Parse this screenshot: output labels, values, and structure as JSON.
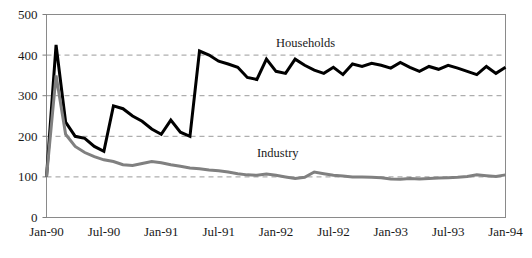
{
  "chart_data": {
    "type": "line",
    "title": "",
    "subtitle": "",
    "xlabel": "",
    "ylabel": "",
    "ylim": [
      0,
      500
    ],
    "yticks": [
      0,
      100,
      200,
      300,
      400,
      500
    ],
    "ytick_labels": [
      "0",
      "100",
      "200",
      "300",
      "400",
      "500"
    ],
    "gridlines": {
      "horizontal": [
        100,
        200,
        300,
        400
      ],
      "style": "dashed",
      "vertical": false
    },
    "legend": {
      "position": "inline-annotation",
      "entries": [
        "Households",
        "Industry"
      ]
    },
    "annotations": [
      {
        "text": "Households",
        "x": "Jan-92",
        "y": 420
      },
      {
        "text": "Industry",
        "x": "Nov-91",
        "y": 150
      }
    ],
    "xtick_labels": [
      "Jan-90",
      "Jul-90",
      "Jan-91",
      "Jul-91",
      "Jan-92",
      "Jul-92",
      "Jan-93",
      "Jul-93",
      "Jan-94"
    ],
    "x": [
      "Jan-90",
      "Feb-90",
      "Mar-90",
      "Apr-90",
      "May-90",
      "Jun-90",
      "Jul-90",
      "Aug-90",
      "Sep-90",
      "Oct-90",
      "Nov-90",
      "Dec-90",
      "Jan-91",
      "Feb-91",
      "Mar-91",
      "Apr-91",
      "May-91",
      "Jun-91",
      "Jul-91",
      "Aug-91",
      "Sep-91",
      "Oct-91",
      "Nov-91",
      "Dec-91",
      "Jan-92",
      "Feb-92",
      "Mar-92",
      "Apr-92",
      "May-92",
      "Jun-92",
      "Jul-92",
      "Aug-92",
      "Sep-92",
      "Oct-92",
      "Nov-92",
      "Dec-92",
      "Jan-93",
      "Feb-93",
      "Mar-93",
      "Apr-93",
      "May-93",
      "Jun-93",
      "Jul-93",
      "Aug-93",
      "Sep-93",
      "Oct-93",
      "Nov-93",
      "Dec-93",
      "Jan-94"
    ],
    "series": [
      {
        "name": "Households",
        "color": "#000000",
        "linewidth": 3,
        "values": [
          100,
          425,
          235,
          200,
          195,
          175,
          163,
          275,
          268,
          250,
          237,
          218,
          205,
          240,
          210,
          200,
          410,
          400,
          385,
          378,
          370,
          345,
          340,
          390,
          360,
          355,
          390,
          375,
          363,
          355,
          370,
          352,
          378,
          372,
          380,
          375,
          368,
          382,
          370,
          360,
          372,
          365,
          375,
          368,
          360,
          352,
          372,
          355,
          370
        ]
      },
      {
        "name": "Industry",
        "color": "#808080",
        "linewidth": 3,
        "values": [
          100,
          350,
          205,
          175,
          160,
          150,
          142,
          138,
          130,
          128,
          133,
          138,
          135,
          130,
          126,
          122,
          120,
          117,
          115,
          112,
          108,
          105,
          104,
          107,
          104,
          100,
          96,
          99,
          112,
          108,
          104,
          102,
          100,
          100,
          99,
          98,
          95,
          94,
          96,
          95,
          96,
          97,
          98,
          99,
          101,
          105,
          103,
          101,
          105
        ]
      }
    ]
  }
}
